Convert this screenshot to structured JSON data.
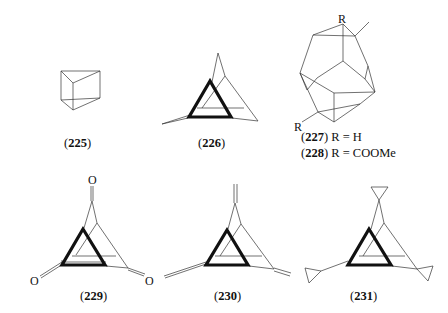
{
  "compounds": [
    {
      "id": "225",
      "label_number": "225",
      "structure": "prismane"
    },
    {
      "id": "226",
      "label_number": "226",
      "structure": "triangulane-cage"
    },
    {
      "id": "227",
      "label_number": "227",
      "substituent": "R = H",
      "structure": "cage-dimer"
    },
    {
      "id": "228",
      "label_number": "228",
      "substituent": "R = COOMe",
      "structure": "cage-dimer"
    },
    {
      "id": "229",
      "label_number": "229",
      "structure": "trione",
      "atom": "O"
    },
    {
      "id": "230",
      "label_number": "230",
      "structure": "trimethylene"
    },
    {
      "id": "231",
      "label_number": "231",
      "structure": "tris-cyclopropylidene"
    }
  ],
  "atoms": {
    "oxygen": "O",
    "r_group": "R"
  },
  "text": {
    "paren_open": "(",
    "paren_close": ")"
  }
}
